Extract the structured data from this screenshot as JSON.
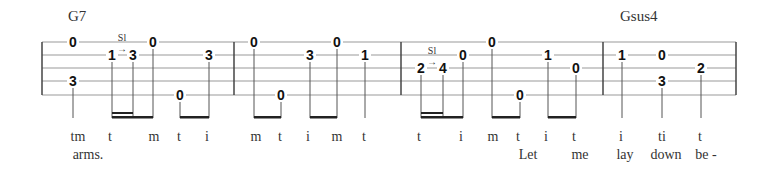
{
  "chords": [
    {
      "name": "G7",
      "x": 68
    },
    {
      "name": "Gsus4",
      "x": 620
    }
  ],
  "staff": {
    "lines_y": [
      42,
      55,
      68,
      81,
      95
    ],
    "left": 42,
    "right": 736,
    "barlines_x": [
      42,
      234,
      401,
      603,
      736
    ],
    "line_color": "#999999"
  },
  "notes": [
    {
      "x": 73,
      "line": 0,
      "fret": "0"
    },
    {
      "x": 73,
      "line": 3,
      "fret": "3"
    },
    {
      "x": 112,
      "line": 1,
      "fret": "1"
    },
    {
      "x": 133,
      "line": 1,
      "fret": "3"
    },
    {
      "x": 153,
      "line": 0,
      "fret": "0"
    },
    {
      "x": 180,
      "line": 4,
      "fret": "0"
    },
    {
      "x": 209,
      "line": 1,
      "fret": "3"
    },
    {
      "x": 254,
      "line": 0,
      "fret": "0"
    },
    {
      "x": 281,
      "line": 4,
      "fret": "0"
    },
    {
      "x": 310,
      "line": 1,
      "fret": "3"
    },
    {
      "x": 337,
      "line": 0,
      "fret": "0"
    },
    {
      "x": 365,
      "line": 1,
      "fret": "1"
    },
    {
      "x": 421,
      "line": 2,
      "fret": "2"
    },
    {
      "x": 443,
      "line": 2,
      "fret": "4"
    },
    {
      "x": 463,
      "line": 1,
      "fret": "0"
    },
    {
      "x": 492,
      "line": 0,
      "fret": "0"
    },
    {
      "x": 520,
      "line": 4,
      "fret": "0"
    },
    {
      "x": 548,
      "line": 1,
      "fret": "1"
    },
    {
      "x": 576,
      "line": 2,
      "fret": "0"
    },
    {
      "x": 622,
      "line": 1,
      "fret": "1"
    },
    {
      "x": 662,
      "line": 1,
      "fret": "0"
    },
    {
      "x": 662,
      "line": 3,
      "fret": "3"
    },
    {
      "x": 701,
      "line": 2,
      "fret": "2"
    }
  ],
  "slides": [
    {
      "x": 122,
      "y": 44,
      "label": "Sl"
    },
    {
      "x": 432,
      "y": 57,
      "label": "Sl"
    }
  ],
  "stems": [
    73,
    112,
    133,
    153,
    180,
    209,
    254,
    281,
    310,
    337,
    365,
    421,
    443,
    463,
    492,
    520,
    548,
    576,
    622,
    662,
    701
  ],
  "beams": [
    {
      "x1": 112,
      "x2": 153,
      "double_to": 133
    },
    {
      "x1": 180,
      "x2": 209
    },
    {
      "x1": 254,
      "x2": 281
    },
    {
      "x1": 310,
      "x2": 337
    },
    {
      "x1": 421,
      "x2": 463,
      "double_to": 443
    },
    {
      "x1": 492,
      "x2": 520
    },
    {
      "x1": 548,
      "x2": 576
    }
  ],
  "fingerings": [
    {
      "x": 78,
      "text": "tm"
    },
    {
      "x": 110,
      "text": "t"
    },
    {
      "x": 154,
      "text": "m"
    },
    {
      "x": 179,
      "text": "t"
    },
    {
      "x": 207,
      "text": "i"
    },
    {
      "x": 256,
      "text": "m"
    },
    {
      "x": 280,
      "text": "t"
    },
    {
      "x": 308,
      "text": "i"
    },
    {
      "x": 337,
      "text": "m"
    },
    {
      "x": 364,
      "text": "t"
    },
    {
      "x": 419,
      "text": "t"
    },
    {
      "x": 461,
      "text": "i"
    },
    {
      "x": 493,
      "text": "m"
    },
    {
      "x": 518,
      "text": "t"
    },
    {
      "x": 546,
      "text": "i"
    },
    {
      "x": 574,
      "text": "t"
    },
    {
      "x": 621,
      "text": "i"
    },
    {
      "x": 662,
      "text": "ti"
    },
    {
      "x": 700,
      "text": "t"
    }
  ],
  "lyrics": [
    {
      "x": 88,
      "text": "arms."
    },
    {
      "x": 528,
      "text": "Let"
    },
    {
      "x": 580,
      "text": "me"
    },
    {
      "x": 625,
      "text": "lay"
    },
    {
      "x": 666,
      "text": "down"
    },
    {
      "x": 706,
      "text": "be -"
    }
  ]
}
